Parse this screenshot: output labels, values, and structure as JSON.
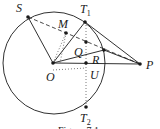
{
  "diagram": {
    "circle": {
      "cx": 54,
      "cy": 63,
      "r": 51
    },
    "points": {
      "O": {
        "x": 53,
        "y": 63,
        "label": "O",
        "lx": 46,
        "ly": 81
      },
      "S": {
        "x": 28,
        "y": 17,
        "label": "S",
        "lx": 16,
        "ly": 12
      },
      "T1": {
        "x": 85,
        "y": 22,
        "label": "T",
        "sub": "1",
        "lx": 80,
        "ly": 13
      },
      "M": {
        "x": 66,
        "y": 33,
        "label": "M",
        "lx": 58,
        "ly": 28
      },
      "Q": {
        "x": 86,
        "y": 42,
        "label": "Q",
        "lx": 74,
        "ly": 56
      },
      "R": {
        "x": 104,
        "y": 50,
        "label": "R",
        "lx": 92,
        "ly": 64
      },
      "U": {
        "x": 86,
        "y": 63,
        "label": "U",
        "lx": 90,
        "ly": 79
      },
      "P": {
        "x": 140,
        "y": 64,
        "label": "P",
        "lx": 146,
        "ly": 69
      },
      "T2": {
        "x": 86,
        "y": 107,
        "label": "T",
        "sub": "2",
        "lx": 80,
        "ly": 122
      }
    },
    "caption": "Figure 7.1",
    "colors": {
      "line": "#1a1a1a",
      "dotted": "#555555",
      "background": "#ffffff"
    }
  }
}
